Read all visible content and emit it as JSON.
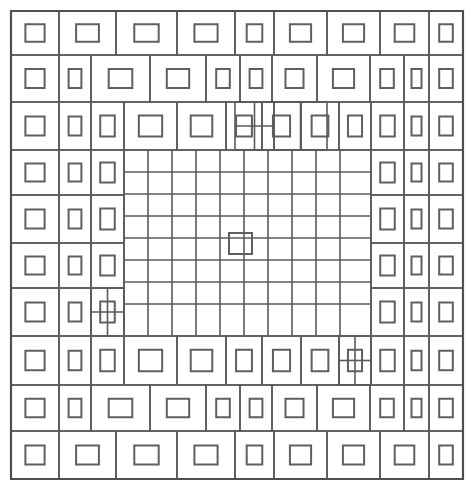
{
  "figure": {
    "title": "Nested concentric rectangle grid pattern",
    "width": 475,
    "height": 491,
    "background_color": "#ffffff",
    "line_color": "#5a5a5a",
    "inner_line_color": "#5f5f5f",
    "frame_color": "#4f4f4f",
    "frame": {
      "x": 11,
      "y": 11,
      "width": 452,
      "height": 468
    }
  },
  "structure": {
    "rings": [
      {
        "name": "ring-1-outer",
        "bounds": {
          "x": 11,
          "y": 11,
          "width": 452,
          "height": 468
        },
        "cols": [
          11,
          59,
          116,
          177,
          235,
          274,
          327,
          380,
          429,
          463
        ],
        "rows": [
          11,
          55,
          102,
          150,
          195,
          243,
          288,
          336,
          385,
          431,
          479
        ],
        "cell_band": 1,
        "inner_inset": 0.3
      },
      {
        "name": "ring-2",
        "bounds": {
          "x": 59,
          "y": 55,
          "width": 370,
          "height": 376
        },
        "cols": [
          59,
          91,
          150,
          206,
          240,
          272,
          317,
          370,
          404,
          429
        ],
        "rows": [
          55,
          102,
          150,
          195,
          243,
          288,
          336,
          385,
          431
        ],
        "cell_band": 1,
        "inner_inset": 0.3
      },
      {
        "name": "ring-3",
        "bounds": {
          "x": 91,
          "y": 102,
          "width": 313,
          "height": 283
        },
        "cols": [
          91,
          124,
          177,
          226,
          262,
          301,
          339,
          371,
          404
        ],
        "rows": [
          102,
          150,
          195,
          243,
          288,
          336,
          385
        ],
        "cell_band": 1,
        "inner_inset": 0.28
      },
      {
        "name": "ring-4",
        "bounds": {
          "x": 124,
          "y": 150,
          "width": 247,
          "height": 186
        },
        "cols": [
          124,
          157,
          190,
          223,
          256,
          289,
          322,
          355,
          371
        ],
        "rows": [
          150,
          195,
          243,
          288,
          336
        ],
        "cell_band": 1,
        "inner_inset": 0.26
      }
    ],
    "core_grid": {
      "name": "core-fine-grid",
      "bounds": {
        "x": 124,
        "y": 150,
        "width": 247,
        "height": 186
      },
      "x_lines": [
        124,
        148,
        172,
        196,
        220,
        244,
        268,
        292,
        316,
        340,
        371
      ],
      "y_lines": [
        150,
        172,
        194,
        216,
        238,
        260,
        282,
        304,
        336
      ],
      "has_center_square": true,
      "center_square": {
        "x": 229,
        "y": 233,
        "width": 23,
        "height": 21
      }
    },
    "corner_accents": [
      {
        "name": "accent-top-left",
        "x": 235,
        "y": 102,
        "width": 39,
        "height": 48,
        "split": "cross"
      },
      {
        "name": "accent-top-right",
        "x": 274,
        "y": 102,
        "width": 53,
        "height": 48,
        "split": "vertical"
      },
      {
        "name": "accent-bottom-left",
        "x": 91,
        "y": 288,
        "width": 33,
        "height": 48,
        "split": "cross"
      },
      {
        "name": "accent-bottom-right",
        "x": 339,
        "y": 336,
        "width": 32,
        "height": 49,
        "split": "cross"
      }
    ]
  },
  "chart_data": {
    "type": "table",
    "title": "Nested concentric rectangle grid pattern",
    "xlabel": "",
    "ylabel": "",
    "categories": [
      "ring-1-outer",
      "ring-2",
      "ring-3",
      "ring-4",
      "core-fine-grid"
    ],
    "values": [
      34,
      30,
      26,
      22,
      80
    ]
  }
}
